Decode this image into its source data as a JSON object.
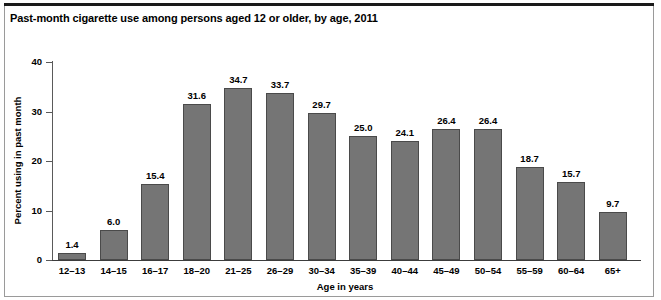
{
  "chart_data": {
    "type": "bar",
    "title": "Past-month cigarette use among persons aged 12 or older, by age, 2011",
    "xlabel": "Age in years",
    "ylabel": "Percent using in past month",
    "ylim": [
      0,
      40
    ],
    "yticks": [
      0,
      10,
      20,
      30,
      40
    ],
    "ytick_labels": [
      "0",
      "10",
      "20",
      "30",
      "40"
    ],
    "grid": false,
    "legend": null,
    "bar_color": "#757575",
    "bar_edge_color": "#4a4a4a",
    "categories": [
      "12–13",
      "14–15",
      "16–17",
      "18–20",
      "21–25",
      "26–29",
      "30–34",
      "35–39",
      "40–44",
      "45–49",
      "50–54",
      "55–59",
      "60–64",
      "65+"
    ],
    "values": [
      1.4,
      6.0,
      15.4,
      31.6,
      34.7,
      33.7,
      29.7,
      25.0,
      24.1,
      26.4,
      26.4,
      18.7,
      15.7,
      9.7
    ],
    "value_labels": [
      "1.4",
      "6.0",
      "15.4",
      "31.6",
      "34.7",
      "33.7",
      "29.7",
      "25.0",
      "24.1",
      "26.4",
      "26.4",
      "18.7",
      "15.7",
      "9.7"
    ]
  }
}
